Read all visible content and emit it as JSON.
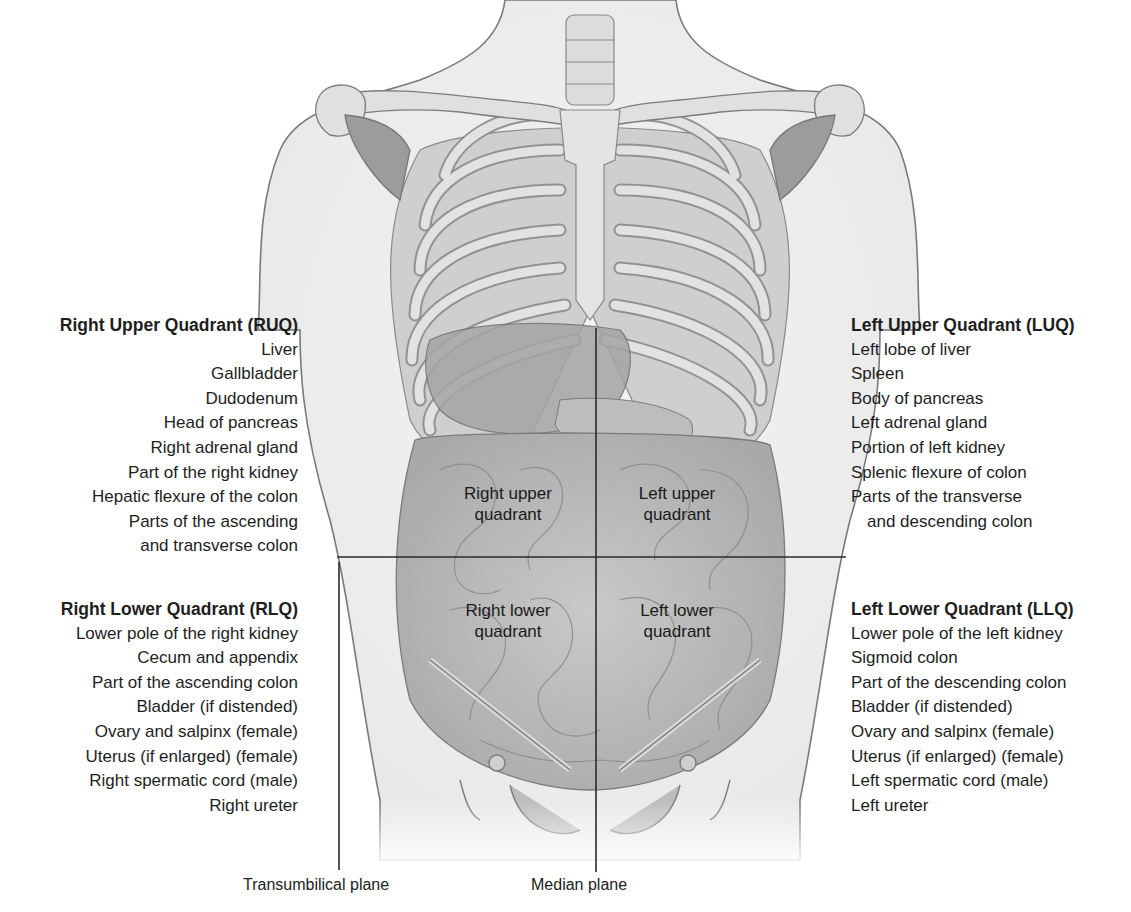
{
  "diagram": {
    "type": "anatomical-quadrants",
    "colors": {
      "background": "#ffffff",
      "text": "#1e1e1e",
      "skin_fill": "#f1f1f1",
      "outline": "#6e6e6e",
      "bone": "#d9d9d9",
      "organ": "#b8b8b8",
      "plane_line": "#2a2a2a"
    }
  },
  "quadrants": {
    "ruq": {
      "title": "Right Upper Quadrant (RUQ)",
      "items": [
        "Liver",
        "Gallbladder",
        "Dudodenum",
        "Head of pancreas",
        "Right adrenal gland",
        "Part of the right kidney",
        "Hepatic flexure of the colon",
        "Parts of the ascending",
        "and transverse colon"
      ]
    },
    "luq": {
      "title": "Left Upper Quadrant (LUQ)",
      "items": [
        "Left lobe of liver",
        "Spleen",
        "Body of pancreas",
        "Left adrenal gland",
        "Portion of left kidney",
        "Splenic flexure of colon",
        "Parts of the transverse",
        "and descending colon"
      ]
    },
    "rlq": {
      "title": "Right Lower Quadrant (RLQ)",
      "items": [
        "Lower pole of the right kidney",
        "Cecum and appendix",
        "Part of the ascending colon",
        "Bladder (if distended)",
        "Ovary and salpinx (female)",
        "Uterus (if enlarged) (female)",
        "Right spermatic cord (male)",
        "Right ureter"
      ]
    },
    "llq": {
      "title": "Left Lower Quadrant (LLQ)",
      "items": [
        "Lower pole of the left kidney",
        "Sigmoid colon",
        "Part of the descending colon",
        "Bladder (if distended)",
        "Ovary and salpinx (female)",
        "Uterus (if enlarged) (female)",
        "Left spermatic cord (male)",
        "Left ureter"
      ]
    }
  },
  "in_figure_labels": {
    "ruq": [
      "Right upper",
      "quadrant"
    ],
    "luq": [
      "Left upper",
      "quadrant"
    ],
    "rlq": [
      "Right lower",
      "quadrant"
    ],
    "llq": [
      "Left lower",
      "quadrant"
    ]
  },
  "planes": {
    "transumbilical": "Transumbilical plane",
    "median": "Median plane"
  }
}
